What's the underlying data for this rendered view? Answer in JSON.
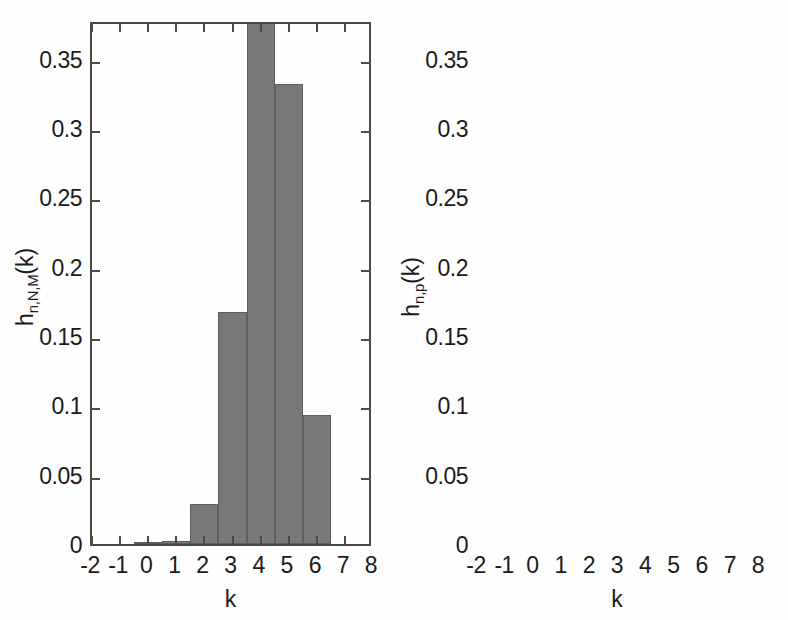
{
  "figure": {
    "background_color": "#fefefe",
    "bar_color": "#787878",
    "axis_color": "#4a4a4a"
  },
  "chart_data": [
    {
      "type": "bar",
      "panel": "left",
      "title": "",
      "xlabel": "k",
      "ylabel": "h_{n,N,M}(k)",
      "ylabel_base": "h",
      "ylabel_sub": "n,N,M",
      "ylabel_arg": "(k)",
      "xlim": [
        -2,
        8
      ],
      "ylim": [
        0,
        0.378
      ],
      "xticks": [
        -2,
        -1,
        0,
        1,
        2,
        3,
        4,
        5,
        6,
        7,
        8
      ],
      "xticklabels": [
        "-2",
        "-1",
        "0",
        "1",
        "2",
        "3",
        "4",
        "5",
        "6",
        "7",
        "8"
      ],
      "yticks": [
        0,
        0.05,
        0.1,
        0.15,
        0.2,
        0.25,
        0.3,
        0.35
      ],
      "yticklabels": [
        "0",
        "0.05",
        "0.1",
        "0.15",
        "0.2",
        "0.25",
        "0.3",
        "0.35"
      ],
      "grid": false,
      "legend": null,
      "categories": [
        0,
        1,
        2,
        3,
        4,
        5,
        6
      ],
      "values": [
        0.0002,
        0.0022,
        0.0292,
        0.1672,
        0.4005,
        0.3322,
        0.0932
      ],
      "clipped_bars": [
        4
      ],
      "bar_width": 1.0
    },
    {
      "type": "bar",
      "panel": "right",
      "title": "",
      "xlabel": "k",
      "ylabel": "h_{n,p}(k)",
      "ylabel_base": "h",
      "ylabel_sub": "n,p",
      "ylabel_arg": "(k)",
      "xlim": [
        -2,
        8
      ],
      "ylim": [
        0,
        0.378
      ],
      "xticks": [
        -2,
        -1,
        0,
        1,
        2,
        3,
        4,
        5,
        6,
        7,
        8
      ],
      "xticklabels": [
        "-2",
        "-1",
        "0",
        "1",
        "2",
        "3",
        "4",
        "5",
        "6",
        "7",
        "8"
      ],
      "yticks": [
        0,
        0.05,
        0.1,
        0.15,
        0.2,
        0.25,
        0.3,
        0.35
      ],
      "yticklabels": [
        "0",
        "0.05",
        "0.1",
        "0.15",
        "0.2",
        "0.25",
        "0.3",
        "0.35"
      ],
      "grid": false,
      "legend": null,
      "categories": [
        0,
        1,
        2,
        3,
        4,
        5,
        6
      ],
      "values": [
        0.0007,
        0.0078,
        0.0512,
        0.1706,
        0.3192,
        0.3192,
        0.1328
      ],
      "clipped_bars": [],
      "bar_width": 1.0
    }
  ]
}
